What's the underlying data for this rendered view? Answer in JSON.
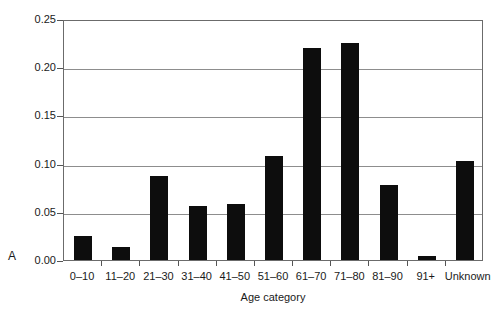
{
  "chart_data": {
    "type": "bar",
    "title": "",
    "panel_label": "A",
    "xlabel": "Age category",
    "ylabel": "Proportion of Patients",
    "categories": [
      "0–10",
      "11–20",
      "21–30",
      "31–40",
      "41–50",
      "51–60",
      "61–70",
      "71–80",
      "81–90",
      "91+",
      "Unknown"
    ],
    "values": [
      0.025,
      0.013,
      0.087,
      0.056,
      0.058,
      0.108,
      0.22,
      0.225,
      0.078,
      0.004,
      0.103
    ],
    "ylim": [
      0,
      0.25
    ],
    "xlim_categories": 11,
    "y_ticks": [
      "0.00",
      "0.05",
      "0.10",
      "0.15",
      "0.20",
      "0.25"
    ],
    "y_tick_values": [
      0.0,
      0.05,
      0.1,
      0.15,
      0.2,
      0.25
    ],
    "grid": true,
    "grid_axis": "y",
    "legend": null,
    "bar_color": "#0d0d0d",
    "grid_color": "#8d8d8d",
    "frame_color": "#6b6b6b"
  }
}
